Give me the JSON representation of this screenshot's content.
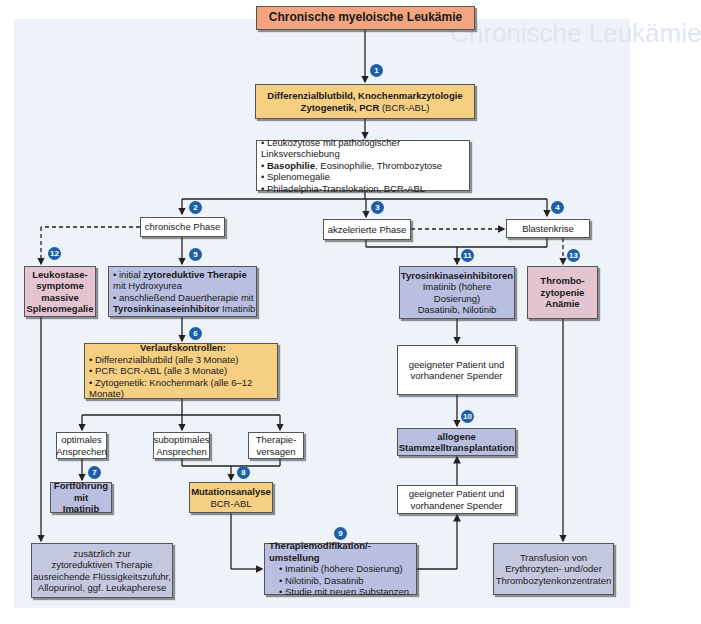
{
  "watermark": "Chronische Leukämie",
  "title": "Chronische myeloische Leukämie",
  "diagnostics": {
    "line1": "Differenzialblutbild, Knochenmarkzytologie",
    "line2_bold": "Zytogenetik, PCR",
    "line2_rest": " (BCR-ABL)"
  },
  "findings": {
    "items": [
      {
        "bold": "",
        "text": "Leukozytose mit pathologischer Linksverschiebung"
      },
      {
        "bold": "Basophilie",
        "text": ", Eosinophilie, Thrombozytose"
      },
      {
        "bold": "",
        "text": "Splenomegalie"
      },
      {
        "bold": "",
        "text": "Philadelphia-Translokation, BCR-ABL"
      }
    ]
  },
  "phases": {
    "chronic": "chronische Phase",
    "accelerated": "akzelerierte Phase",
    "blast": "Blastenkrise"
  },
  "leukostase": {
    "line1": "Leukostase-",
    "line2": "symptome",
    "line3": "massive",
    "line4": "Splenomegalie"
  },
  "zytoreduktiv": {
    "item1_pre": "initial ",
    "item1_bold": "zytoreduktive Therapie",
    "item1_post": " mit Hydroxyurea",
    "item2_pre": "anschließend Dauertherapie mit ",
    "item2_bold": "Tyrosinkinaseeinhibitor",
    "item2_post": " Imatinib"
  },
  "tki": {
    "title": "Tyrosinkinaseinhibitoren",
    "line1": "Imatinib (höhere Dosierung)",
    "line2": "Dasatinib, Nilotinib"
  },
  "thrombo": {
    "line1": "Thrombo-",
    "line2": "zytopenie",
    "line3": "Anämie"
  },
  "verlauf": {
    "title": "Verlaufskontrollen:",
    "items": [
      "Differenzialblutbild (alle 3 Monate)",
      "PCR: BCR-ABL (alle 3 Monate)",
      "Zytogenetik: Knochenmark (alle 6–12 Monate)"
    ]
  },
  "response": {
    "optimal": {
      "line1": "optimales",
      "line2": "Ansprechen"
    },
    "suboptimal": {
      "line1": "suboptimales",
      "line2": "Ansprechen"
    },
    "failure": {
      "line1": "Therapie-",
      "line2": "versagen"
    }
  },
  "continue": {
    "line1": "Fortführung mit",
    "line2": "Imatinib"
  },
  "mutation": {
    "title": "Mutationsanalyse",
    "sub": "BCR-ABL"
  },
  "supportive": {
    "line1": "zusätzlich zur",
    "line2": "zytoreduktiven Therapie",
    "line3": "ausreichende Flüssigkeitszufuhr,",
    "line4": "Allopurinol, ggf. Leukapherese"
  },
  "modification": {
    "title": "Therapiemodifikation/-umstellung",
    "items": [
      "Imatinib (höhere Dosierung)",
      "Nilotinib, Dasatinib",
      "Studie mit neuen Substanzen"
    ]
  },
  "donor1": {
    "line1": "geeigneter Patient und",
    "line2": "vorhandener Spender"
  },
  "donor2": {
    "line1": "geeigneter Patient und",
    "line2": "vorhandener Spender"
  },
  "transplant": {
    "line1": "allogene",
    "line2": "Stammzelltransplantation"
  },
  "transfusion": {
    "line1": "Transfusion von",
    "line2": "Erythrozyten- und/oder",
    "line3": "Thrombozytenkonzentraten"
  },
  "badges": [
    "1",
    "2",
    "3",
    "4",
    "5",
    "6",
    "7",
    "8",
    "9",
    "10",
    "11",
    "12",
    "13"
  ],
  "colors": {
    "background_panel": "#eef3fa",
    "title_box": "#f2a57e",
    "yellow_box": "#f6cf82",
    "blue_box": "#b9bfe0",
    "pink_box": "#e3c4d0",
    "badge": "#1e5fa8"
  }
}
